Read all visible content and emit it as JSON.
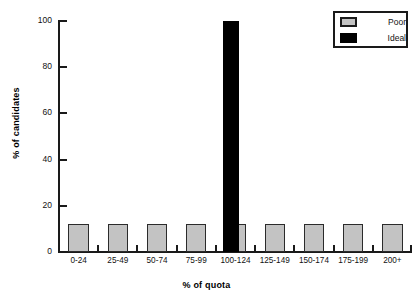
{
  "chart_data": {
    "type": "bar",
    "title": "",
    "xlabel": "% of quota",
    "ylabel": "% of candidates",
    "categories": [
      "0-24",
      "25-49",
      "50-74",
      "75-99",
      "100-124",
      "125-149",
      "150-174",
      "175-199",
      "200+"
    ],
    "series": [
      {
        "name": "Poor",
        "color": "#c3c3c3",
        "values": [
          12,
          12,
          12,
          12,
          12,
          12,
          12,
          12,
          12
        ]
      },
      {
        "name": "Ideal",
        "color": "#000000",
        "values": [
          0,
          0,
          0,
          0,
          100,
          0,
          0,
          0,
          0
        ]
      }
    ],
    "ylim": [
      0,
      100
    ],
    "yticks": [
      0,
      20,
      40,
      60,
      80,
      100
    ],
    "ytick_labels": [
      "0",
      "20",
      "40",
      "60",
      "80",
      "100"
    ],
    "grid": false,
    "legend_position": "top-right"
  },
  "legend": {
    "entries": [
      {
        "label": "Poor",
        "swatch": "gray-swatch"
      },
      {
        "label": "Ideal",
        "swatch": "black-swatch"
      }
    ]
  }
}
